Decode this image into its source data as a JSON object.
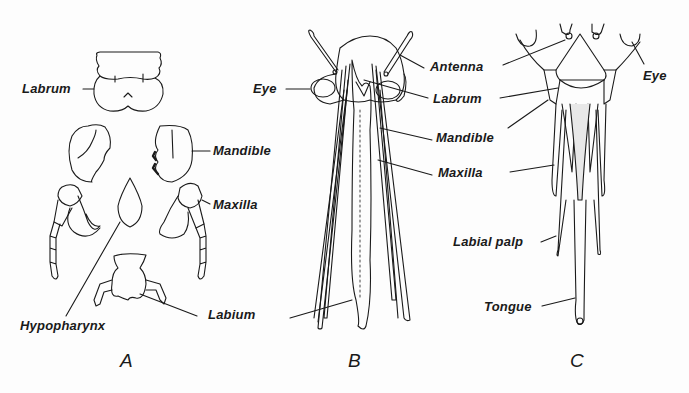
{
  "figure": {
    "panels": [
      {
        "id": "A",
        "letter": "A",
        "labels": {
          "labrum": "Labrum",
          "mandible": "Mandible",
          "maxilla": "Maxilla",
          "hypopharynx": "Hypopharynx",
          "labium": "Labium"
        }
      },
      {
        "id": "B",
        "letter": "B",
        "labels": {
          "eye": "Eye",
          "antenna": "Antenna",
          "labrum": "Labrum",
          "mandible": "Mandible",
          "maxilla": "Maxilla"
        }
      },
      {
        "id": "C",
        "letter": "C",
        "labels": {
          "eye": "Eye",
          "labial_palp": "Labial palp",
          "tongue": "Tongue"
        }
      }
    ],
    "colors": {
      "ink": "#1a1a1a",
      "paper": "#fdfdfd"
    }
  }
}
